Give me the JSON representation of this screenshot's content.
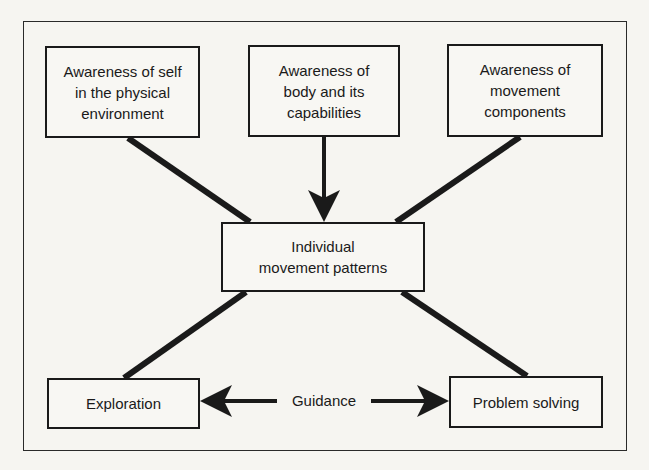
{
  "diagram": {
    "type": "concept-map",
    "nodes": {
      "self_environment": {
        "label": "Awareness of self\nin the physical\nenvironment"
      },
      "body_capabilities": {
        "label": "Awareness of\nbody and its\ncapabilities"
      },
      "movement_components": {
        "label": "Awareness of\nmovement\ncomponents"
      },
      "individual_patterns": {
        "label": "Individual\nmovement patterns"
      },
      "exploration": {
        "label": "Exploration"
      },
      "problem_solving": {
        "label": "Problem solving"
      }
    },
    "connector_label": {
      "guidance": "Guidance"
    },
    "edges": [
      {
        "from": "self_environment",
        "to": "individual_patterns",
        "style": "thick-line"
      },
      {
        "from": "body_capabilities",
        "to": "individual_patterns",
        "style": "arrow"
      },
      {
        "from": "movement_components",
        "to": "individual_patterns",
        "style": "thick-line"
      },
      {
        "from": "individual_patterns",
        "to": "exploration",
        "style": "thick-line"
      },
      {
        "from": "individual_patterns",
        "to": "problem_solving",
        "style": "thick-line"
      },
      {
        "from": "guidance",
        "to": "exploration",
        "style": "arrow"
      },
      {
        "from": "guidance",
        "to": "problem_solving",
        "style": "arrow"
      }
    ],
    "colors": {
      "ink": "#1a1a1a",
      "paper": "#f6f5f1"
    }
  }
}
